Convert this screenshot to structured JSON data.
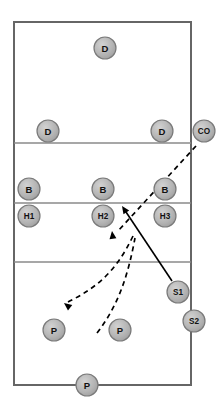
{
  "diagram": {
    "court": {
      "left": 14,
      "top": 22,
      "right": 191,
      "bottom": 385,
      "divider_rows": [
        143,
        203,
        262
      ],
      "line_color": "#666666",
      "fill_color": "#ffffff"
    },
    "marker_style": {
      "radius": 11,
      "fill_color": "#b3b3b3",
      "border_color": "#7a7a7a",
      "label_color": "#111111"
    },
    "markers": [
      {
        "id": "d-top",
        "label": "D",
        "x": 105,
        "y": 48
      },
      {
        "id": "d-left",
        "label": "D",
        "x": 48,
        "y": 131
      },
      {
        "id": "d-right",
        "label": "D",
        "x": 162,
        "y": 131
      },
      {
        "id": "co",
        "label": "CO",
        "x": 204,
        "y": 131
      },
      {
        "id": "b-left",
        "label": "B",
        "x": 29,
        "y": 189
      },
      {
        "id": "b-middle",
        "label": "B",
        "x": 103,
        "y": 189
      },
      {
        "id": "b-right",
        "label": "B",
        "x": 165,
        "y": 189
      },
      {
        "id": "h1",
        "label": "H1",
        "x": 29,
        "y": 216
      },
      {
        "id": "h2",
        "label": "H2",
        "x": 103,
        "y": 216
      },
      {
        "id": "h3",
        "label": "H3",
        "x": 165,
        "y": 216
      },
      {
        "id": "s1",
        "label": "S1",
        "x": 178,
        "y": 292
      },
      {
        "id": "s2",
        "label": "S2",
        "x": 194,
        "y": 321
      },
      {
        "id": "p-left",
        "label": "P",
        "x": 54,
        "y": 330
      },
      {
        "id": "p-middle",
        "label": "P",
        "x": 120,
        "y": 330
      },
      {
        "id": "p-bottom",
        "label": "P",
        "x": 87,
        "y": 385
      }
    ],
    "paths": [
      {
        "id": "serve-path-solid",
        "style": "solid",
        "d": "M 172 281 L 124 209",
        "arrow_at": {
          "x": 122,
          "y": 206,
          "angle": -124
        }
      },
      {
        "id": "coach-toss-dashed",
        "style": "dashed",
        "d": "M 196 146 L 118 231",
        "arrow_at": {
          "x": 112,
          "y": 231,
          "angle": -97
        }
      },
      {
        "id": "receive-path-dashed",
        "style": "dashed",
        "d": "M 97 333 C 118 306, 128 276, 135 238",
        "arrow_at": {
          "x": 64,
          "y": 303,
          "angle": 218
        }
      }
    ],
    "dashed_return_path": {
      "id": "dig-return-dashed",
      "style": "dashed",
      "d": "M 133 236 C 116 272, 96 288, 68 302"
    }
  },
  "legend": {
    "d_label": "D",
    "b_label": "B",
    "p_label": "P",
    "co_label": "CO"
  }
}
